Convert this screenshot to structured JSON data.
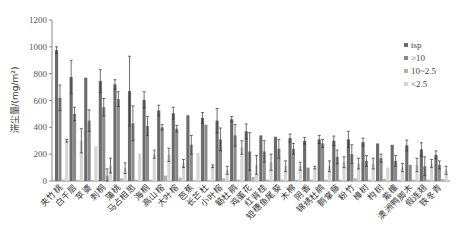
{
  "chart_data": {
    "type": "bar",
    "title": "",
    "xlabel": "",
    "ylabel": "滞尘量/(mg/m²)",
    "ylim": [
      0,
      1200
    ],
    "yticks": [
      0,
      200,
      400,
      600,
      800,
      1000,
      1200
    ],
    "grid": false,
    "legend_position": "right",
    "categories": [
      "夹竹桃",
      "白千层",
      "苹婆",
      "刺桐",
      "蒲桃",
      "马占相思",
      "海桐",
      "高山榕",
      "大叶榕",
      "芭蕉",
      "长芒杜",
      "小叶榕",
      "簕杜鹃",
      "鸡蛋花",
      "红背桂",
      "短穗鱼尾葵",
      "木棉",
      "阴香",
      "锦绣杜鹃",
      "鹅掌藤",
      "粉竹",
      "樟树",
      "构树",
      "紫檀",
      "澳洲鸭脚木",
      "假连翘",
      "铁冬青"
    ],
    "series": [
      {
        "name": "tsp",
        "color": "#6b6b6b",
        "values": [
          975,
          775,
          770,
          745,
          720,
          670,
          605,
          525,
          505,
          490,
          470,
          450,
          460,
          370,
          340,
          330,
          320,
          300,
          310,
          300,
          310,
          290,
          280,
          270,
          265,
          235,
          195
        ],
        "errors": [
          25,
          125,
          0,
          85,
          35,
          260,
          60,
          40,
          45,
          0,
          40,
          90,
          20,
          55,
          0,
          0,
          30,
          25,
          30,
          35,
          60,
          30,
          0,
          0,
          40,
          50,
          30
        ]
      },
      {
        "name": ">10",
        "color": "#8a8a8a",
        "values": [
          620,
          500,
          450,
          550,
          610,
          430,
          410,
          400,
          390,
          270,
          420,
          310,
          340,
          220,
          220,
          240,
          240,
          100,
          280,
          180,
          200,
          150,
          170,
          150,
          120,
          110,
          120
        ],
        "errors": [
          95,
          50,
          80,
          65,
          55,
          130,
          70,
          20,
          25,
          70,
          0,
          85,
          80,
          140,
          80,
          70,
          40,
          0,
          30,
          50,
          70,
          40,
          30,
          40,
          0,
          70,
          30
        ]
      },
      {
        "name": "10~2.5",
        "color": "#b0b0b0",
        "values": [
          10,
          5,
          5,
          40,
          20,
          10,
          10,
          40,
          25,
          0,
          5,
          20,
          10,
          30,
          10,
          10,
          10,
          10,
          10,
          10,
          20,
          10,
          15,
          10,
          10,
          10,
          15
        ],
        "errors": [
          0,
          0,
          0,
          50,
          0,
          0,
          0,
          0,
          0,
          0,
          0,
          0,
          0,
          0,
          0,
          0,
          0,
          0,
          0,
          0,
          0,
          0,
          0,
          0,
          0,
          0,
          0
        ]
      },
      {
        "name": "<2.5",
        "color": "#d4d4d4",
        "values": [
          300,
          300,
          260,
          115,
          95,
          205,
          200,
          195,
          130,
          210,
          110,
          80,
          250,
          120,
          140,
          110,
          110,
          100,
          110,
          140,
          130,
          130,
          100,
          100,
          120,
          130,
          80
        ],
        "errors": [
          10,
          90,
          0,
          55,
          40,
          0,
          30,
          50,
          30,
          0,
          10,
          30,
          50,
          70,
          60,
          40,
          30,
          10,
          40,
          40,
          40,
          40,
          0,
          30,
          50,
          30,
          30
        ]
      }
    ]
  }
}
